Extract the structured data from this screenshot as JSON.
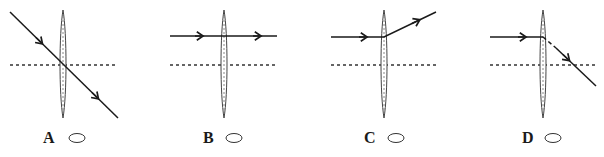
{
  "diagram": {
    "colors": {
      "ray": "#1a1a1a",
      "axis": "#333333",
      "lens": "#444444",
      "background": "#ffffff"
    },
    "options": [
      {
        "label": "A",
        "description": "Ray passes straight through lens center, crossing principal axis at the lens",
        "choice": "radio-empty"
      },
      {
        "label": "B",
        "description": "Ray parallel to axis passes through lens undeviated",
        "choice": "radio-empty"
      },
      {
        "label": "C",
        "description": "Ray parallel to axis bends upward away from axis after lens",
        "choice": "radio-empty"
      },
      {
        "label": "D",
        "description": "Ray parallel to axis bends downward toward axis after lens, crossing it",
        "choice": "radio-empty"
      }
    ]
  }
}
